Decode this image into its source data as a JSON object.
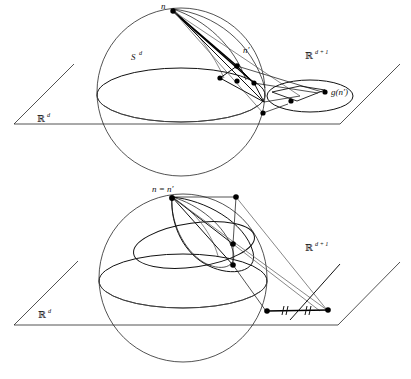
{
  "figure": {
    "panels": [
      {
        "id": "top",
        "labels": {
          "north_pole": "n",
          "point_prime": "n′",
          "sphere": "S",
          "sphere_sup": "d",
          "ambient": "ℝ",
          "ambient_sup": "d + 1",
          "base_plane": "ℝ",
          "base_plane_sup": "d",
          "image": "g(n′)"
        }
      },
      {
        "id": "bottom",
        "labels": {
          "north_pole_equality": "n = n′",
          "ambient": "ℝ",
          "ambient_sup": "d + 1",
          "base_plane": "ℝ",
          "base_plane_sup": "d",
          "tick_left": "‖",
          "tick_right": "‖"
        }
      }
    ],
    "colors": {
      "ink": "#111111",
      "light_ink": "#555555",
      "paper": "#ffffff"
    }
  }
}
